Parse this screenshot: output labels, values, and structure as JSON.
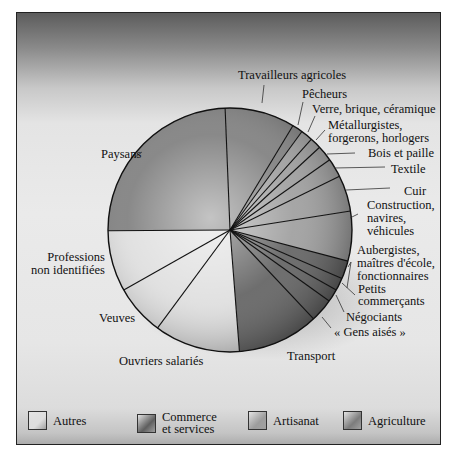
{
  "chart_data": {
    "type": "pie",
    "title": "",
    "start_angle_deg": -2.3,
    "direction": "clockwise",
    "legend": {
      "position": "bottom",
      "entries": [
        {
          "key": "autres",
          "label": "Autres",
          "color": "#dedede"
        },
        {
          "key": "commerce",
          "label": "Commerce et services",
          "label_lines": [
            "Commerce",
            "et services"
          ],
          "color": "#5e5e5e"
        },
        {
          "key": "artisanat",
          "label": "Artisanat",
          "color": "#9c9c9c"
        },
        {
          "key": "agriculture",
          "label": "Agriculture",
          "color": "#7c7c7c"
        }
      ]
    },
    "slices": [
      {
        "label": "Travailleurs agricoles",
        "category": "agriculture",
        "value": 9.3
      },
      {
        "label": "Pêcheurs",
        "category": "agriculture",
        "value": 1.4
      },
      {
        "label": "Verre, brique, céramique",
        "category": "artisanat",
        "value": 1.6
      },
      {
        "label": "Métallurgistes, forgerons, horlogers",
        "category": "artisanat",
        "value": 1.5
      },
      {
        "label": "Bois et paille",
        "category": "artisanat",
        "value": 2.1
      },
      {
        "label": "Textile",
        "category": "artisanat",
        "value": 2.5
      },
      {
        "label": "Cuir",
        "category": "artisanat",
        "value": 4.8
      },
      {
        "label": "Construction, navires, véhicules",
        "category": "artisanat",
        "value": 6.6
      },
      {
        "label": "Aubergistes, maîtres d'école, fonctionnaires",
        "category": "commerce",
        "value": 2.4
      },
      {
        "label": "Petits commerçants",
        "category": "commerce",
        "value": 1.7
      },
      {
        "label": "Négociants",
        "category": "commerce",
        "value": 1.7
      },
      {
        "label": "« Gens aisés »",
        "category": "commerce",
        "value": 3.1
      },
      {
        "label": "Transport",
        "category": "commerce",
        "value": 10.8
      },
      {
        "label": "Ouvriers salariés",
        "category": "autres",
        "value": 11.4
      },
      {
        "label": "Veuves",
        "category": "autres",
        "value": 6.7
      },
      {
        "label": "Professions non identifiées",
        "category": "autres",
        "value": 8.1
      },
      {
        "label": "Paysans",
        "category": "agriculture",
        "value": 24.5
      }
    ],
    "units": "approx. % (estimated from slice angles)"
  },
  "labels": {
    "travailleurs": "Travailleurs agricoles",
    "pecheurs": "Pêcheurs",
    "verre": "Verre, brique, céramique",
    "metal_1": "Métallurgistes,",
    "metal_2": "forgerons, horlogers",
    "bois": "Bois et paille",
    "textile": "Textile",
    "cuir": "Cuir",
    "construction_1": "Construction,",
    "construction_2": "navires,",
    "construction_3": "véhicules",
    "auberg_1": "Aubergistes,",
    "auberg_2": "maîtres d'école,",
    "auberg_3": "fonctionnaires",
    "petits_1": "Petits",
    "petits_2": "commerçants",
    "negociants": "Négociants",
    "gens": "« Gens aisés »",
    "transport": "Transport",
    "ouvriers": "Ouvriers salariés",
    "veuves": "Veuves",
    "professions_1": "Professions",
    "professions_2": "non identifiées",
    "paysans": "Paysans"
  }
}
